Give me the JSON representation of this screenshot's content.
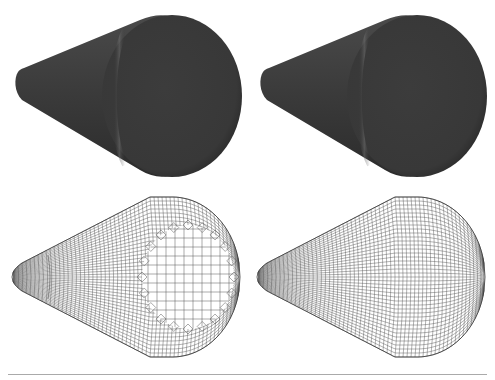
{
  "figure": {
    "panels": [
      {
        "id": "shaded-left",
        "kind": "shaded-surface",
        "row": 1,
        "col": 1
      },
      {
        "id": "shaded-right",
        "kind": "shaded-surface",
        "row": 1,
        "col": 2
      },
      {
        "id": "wireframe-left",
        "kind": "wireframe-mesh",
        "row": 2,
        "col": 1,
        "note": "irregular mesh with triangle artifacts around cap"
      },
      {
        "id": "wireframe-right",
        "kind": "wireframe-mesh",
        "row": 2,
        "col": 2,
        "note": "regular quad mesh"
      }
    ],
    "colors": {
      "surface": "#3a3a3a",
      "surface_highlight": "#6a6a6a",
      "wire": "#555555",
      "rule": "#aaaaaa"
    }
  }
}
